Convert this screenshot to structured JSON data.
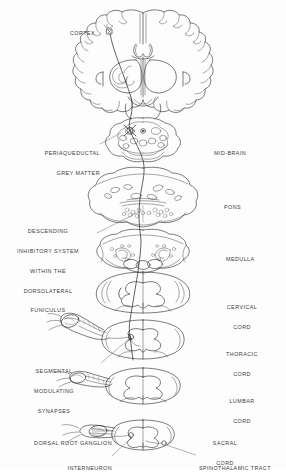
{
  "figure": {
    "title": "Descending inhibitory system within the dorsolateral funiculus",
    "orientation": "vertical stack of CNS cross-sections, rostral (top) to caudal (bottom)",
    "ink_color": "#2a2a2a",
    "background_color": "#ffffff"
  },
  "labels_left": [
    {
      "id": "cortex",
      "text": "CORTEX",
      "lines": [
        "CORTEX"
      ],
      "x": 70,
      "y": 19,
      "align": "left",
      "leader": false
    },
    {
      "id": "periaqueductal-grey-matter",
      "text": "PERIAQUEDUCTAL GREY MATTER",
      "lines": [
        "PERIAQUEDUCTAL",
        "GREY MATTER"
      ],
      "x": 28,
      "y": 139,
      "align": "left",
      "leader": true
    },
    {
      "id": "descending-inhibitory-system",
      "text": "DESCENDING INHIBITORY SYSTEM WITHIN THE DORSOLATERAL FUNICULUS",
      "lines": [
        "DESCENDING",
        "INHIBITORY SYSTEM",
        "WITHIN THE",
        "DORSOLATERAL",
        "FUNICULUS"
      ],
      "x": 14,
      "y": 219,
      "align": "center",
      "leader": true
    },
    {
      "id": "segmental-modulating-synapses",
      "text": "SEGMENTAL MODULATING SYNAPSES",
      "lines": [
        "SEGMENTAL",
        "MODULATING",
        "SYNAPSES"
      ],
      "x": 40,
      "y": 358,
      "align": "center",
      "leader": true
    },
    {
      "id": "dorsal-root-ganglion",
      "text": "DORSAL ROOT GANGLION",
      "lines": [
        "DORSAL ROOT GANGLION"
      ],
      "x": 26,
      "y": 428,
      "align": "left",
      "leader": true
    },
    {
      "id": "interneuron",
      "text": "INTERNEURON",
      "lines": [
        "INTERNEURON"
      ],
      "x": 58,
      "y": 453,
      "align": "left",
      "leader": true
    }
  ],
  "labels_right": [
    {
      "id": "mid-brain",
      "text": "MID-BRAIN",
      "lines": [
        "MID-BRAIN"
      ],
      "x": 214,
      "y": 139,
      "align": "left",
      "leader": false
    },
    {
      "id": "pons",
      "text": "PONS",
      "lines": [
        "PONS"
      ],
      "x": 224,
      "y": 184,
      "align": "left",
      "leader": false
    },
    {
      "id": "medulla",
      "text": "MEDULLA",
      "lines": [
        "MEDULLA"
      ],
      "x": 226,
      "y": 243,
      "align": "left",
      "leader": false
    },
    {
      "id": "cervical-cord",
      "text": "CERVICAL CORD",
      "lines": [
        "CERVICAL",
        "CORD"
      ],
      "x": 213,
      "y": 294,
      "align": "center",
      "leader": false
    },
    {
      "id": "thoracic-cord",
      "text": "THORACIC CORD",
      "lines": [
        "THORACIC",
        "CORD"
      ],
      "x": 213,
      "y": 341,
      "align": "center",
      "leader": false
    },
    {
      "id": "lumbar-cord",
      "text": "LUMBAR CORD",
      "lines": [
        "LUMBAR",
        "CORD"
      ],
      "x": 213,
      "y": 388,
      "align": "center",
      "leader": false
    },
    {
      "id": "sacral-cord",
      "text": "SACRAL CORD",
      "lines": [
        "SACRAL",
        "CORD"
      ],
      "x": 203,
      "y": 430,
      "align": "center",
      "leader": false
    },
    {
      "id": "spinothalamic-tract",
      "text": "SPINOTHALAMIC TRACT",
      "lines": [
        "SPINOTHALAMIC TRACT"
      ],
      "x": 197,
      "y": 452,
      "align": "left",
      "leader": true
    }
  ],
  "sections": [
    {
      "id": "cerebrum",
      "name": "Coronal section of cerebrum (cortex, basal ganglia, thalamus)",
      "center_y": 62
    },
    {
      "id": "midbrain",
      "name": "Mid-brain cross-section with periaqueductal grey matter",
      "center_y": 140
    },
    {
      "id": "pons",
      "name": "Pons cross-section",
      "center_y": 193
    },
    {
      "id": "medulla",
      "name": "Medulla cross-section",
      "center_y": 247
    },
    {
      "id": "cervical",
      "name": "Cervical spinal cord cross-section",
      "center_y": 292
    },
    {
      "id": "thoracic",
      "name": "Thoracic spinal cord cross-section with dorsal root",
      "center_y": 340
    },
    {
      "id": "lumbar",
      "name": "Lumbar spinal cord cross-section with dorsal root",
      "center_y": 388
    },
    {
      "id": "sacral",
      "name": "Sacral spinal cord cross-section with dorsal root ganglion",
      "center_y": 437
    }
  ]
}
